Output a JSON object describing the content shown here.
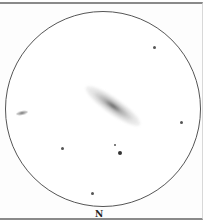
{
  "sketch": {
    "subject": "edge-on spiral galaxy eyepiece sketch",
    "orientation_label": "N",
    "stars": [
      {
        "x": 154,
        "y": 47,
        "size": 3
      },
      {
        "x": 181,
        "y": 122,
        "size": 3
      },
      {
        "x": 62,
        "y": 148,
        "size": 3
      },
      {
        "x": 115,
        "y": 145,
        "size": 2
      },
      {
        "x": 120,
        "y": 153,
        "size": 4
      },
      {
        "x": 92,
        "y": 193,
        "size": 3
      }
    ]
  }
}
